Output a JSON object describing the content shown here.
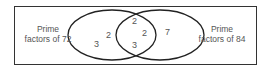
{
  "diagram": {
    "type": "venn",
    "sets": [
      {
        "label_line1": "Prime",
        "label_line2": "factors of 72",
        "only": [
          "2",
          "3"
        ]
      },
      {
        "label_line1": "Prime",
        "label_line2": "factors of 84",
        "only": [
          "7"
        ]
      }
    ],
    "intersection": [
      "2",
      "2",
      "3"
    ],
    "colors": {
      "stroke": "#222222",
      "text": "#555555",
      "background": "#ffffff"
    }
  }
}
